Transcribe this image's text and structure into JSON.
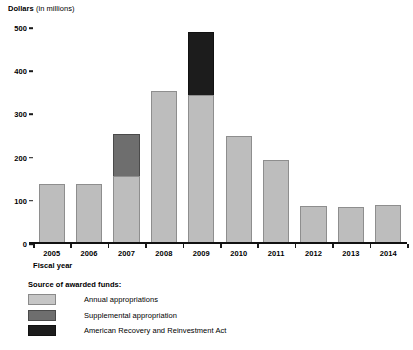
{
  "chart_data": {
    "type": "bar",
    "title": "",
    "subtitle": "",
    "ylabel_strong": "Dollars",
    "ylabel_light": "(in millions)",
    "xlabel": "Fiscal year",
    "ylim": [
      0,
      500
    ],
    "y_ticks": [
      0,
      100,
      200,
      300,
      400,
      500
    ],
    "y_tick_labels": [
      "0",
      "100",
      "200",
      "300",
      "400",
      "500"
    ],
    "grid": false,
    "stacked": true,
    "legend_position": "below",
    "legend_title": "Source of awarded funds:",
    "categories": [
      "2005",
      "2006",
      "2007",
      "2008",
      "2009",
      "2010",
      "2011",
      "2012",
      "2013",
      "2014"
    ],
    "series": [
      {
        "name": "Annual appropriations",
        "color": "#c6c6c6",
        "values": [
          140,
          138,
          158,
          355,
          345,
          250,
          195,
          88,
          85,
          90
        ]
      },
      {
        "name": "Supplemental appropriation",
        "color": "#6e6e6e",
        "values": [
          0,
          0,
          97,
          0,
          0,
          0,
          0,
          0,
          0,
          0
        ]
      },
      {
        "name": "American Recovery and Reinvestment Act",
        "color": "#1c1c1c",
        "values": [
          0,
          0,
          0,
          0,
          145,
          0,
          0,
          0,
          0,
          0
        ]
      }
    ],
    "totals": [
      140,
      138,
      255,
      355,
      490,
      250,
      195,
      88,
      85,
      90
    ]
  }
}
